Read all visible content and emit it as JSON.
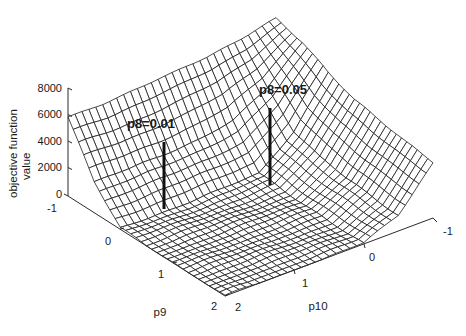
{
  "chart_data": {
    "type": "surface",
    "title": "",
    "xlabel": "p9",
    "ylabel": "p10",
    "zlabel": "objective function value",
    "zlabel_lines": [
      "objective function",
      "value"
    ],
    "x_ticks": [
      "-1",
      "0",
      "1",
      "2"
    ],
    "y_ticks": [
      "-1",
      "0",
      "1",
      "2"
    ],
    "z_ticks": [
      "0",
      "2000",
      "4000",
      "6000",
      "8000"
    ],
    "xlim": [
      -1,
      2
    ],
    "ylim": [
      -1,
      2
    ],
    "zlim": [
      0,
      8000
    ],
    "grid": false,
    "legend": null,
    "surface_samples": {
      "p9": [
        -1,
        -0.5,
        0,
        0.5,
        1,
        1.5,
        2
      ],
      "p10": [
        -1,
        -0.5,
        0,
        0.5,
        1,
        1.5,
        2
      ],
      "z_approx_rows_by_p9": [
        [
          7500,
          7000,
          6600,
          6300,
          6100,
          6000,
          6000
        ],
        [
          7000,
          4500,
          3000,
          2600,
          2400,
          2300,
          2300
        ],
        [
          6000,
          2500,
          300,
          150,
          100,
          100,
          100
        ],
        [
          5200,
          1800,
          150,
          80,
          60,
          50,
          50
        ],
        [
          4800,
          1500,
          100,
          60,
          40,
          30,
          30
        ],
        [
          4400,
          1300,
          80,
          40,
          30,
          20,
          20
        ],
        [
          4200,
          1200,
          60,
          30,
          20,
          10,
          10
        ]
      ]
    },
    "annotations": [
      {
        "label": "p8=0.01",
        "p9": 0.1,
        "p10": 1.2,
        "z_stem": 4200
      },
      {
        "label": "p8=0.05",
        "p9": 0.0,
        "p10": 0.05,
        "z_stem": 4200
      }
    ]
  },
  "axes": {
    "z_ticks": [
      "0",
      "2000",
      "4000",
      "6000",
      "8000"
    ],
    "p9_ticks": [
      "-1",
      "0",
      "1",
      "2"
    ],
    "p10_ticks": [
      "-1",
      "0",
      "1",
      "2"
    ],
    "p9_label": "p9",
    "p10_label": "p10",
    "z_label_line1": "objective function",
    "z_label_line2": "value"
  },
  "annotations": {
    "left": "p8=0.01",
    "right": "p8=0.05"
  },
  "colors": {
    "mesh": "#1e1e1e",
    "axis": "#2a2a2a",
    "background": "#ffffff"
  }
}
